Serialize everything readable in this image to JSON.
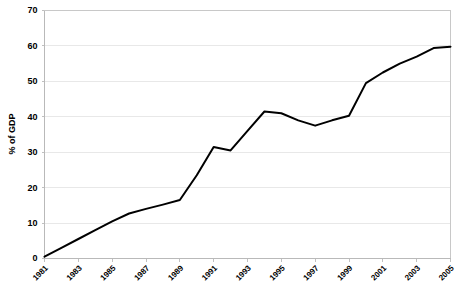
{
  "chart_data": {
    "type": "line",
    "title": "",
    "subtitle": "",
    "xlabel": "",
    "ylabel": "% of GDP",
    "ylim": [
      0,
      70
    ],
    "yticks": [
      0,
      10,
      20,
      30,
      40,
      50,
      60,
      70
    ],
    "ytick_labels": [
      "0",
      "10",
      "20",
      "30",
      "40",
      "50",
      "60",
      "70"
    ],
    "xlim": [
      1981,
      2005
    ],
    "xticks": [
      1981,
      1983,
      1985,
      1987,
      1989,
      1991,
      1993,
      1995,
      1997,
      1999,
      2001,
      2003,
      2005
    ],
    "xtick_labels": [
      "1981",
      "1983",
      "1985",
      "1987",
      "1989",
      "1991",
      "1993",
      "1995",
      "1997",
      "1999",
      "2001",
      "2003",
      "2005"
    ],
    "grid": true,
    "grid_axis": "y",
    "legend": false,
    "legend_position": "none",
    "line_color": "#000000",
    "grid_color": "#e8e8e8",
    "frame_color": "#c8c8c8",
    "background_color": "#ffffff",
    "x": [
      1981,
      1982,
      1983,
      1984,
      1985,
      1986,
      1987,
      1988,
      1989,
      1990,
      1991,
      1992,
      1993,
      1994,
      1995,
      1996,
      1997,
      1998,
      1999,
      2000,
      2001,
      2002,
      2003,
      2004,
      2005
    ],
    "series": [
      {
        "name": "% of GDP",
        "values": [
          0.5,
          3.0,
          5.5,
          8.0,
          10.5,
          12.7,
          14.0,
          15.2,
          16.5,
          23.5,
          31.5,
          30.5,
          36.0,
          41.5,
          41.0,
          39.0,
          37.5,
          39.0,
          40.3,
          49.5,
          52.5,
          55.0,
          57.0,
          59.4,
          59.8
        ]
      }
    ]
  },
  "axes": {
    "y_axis_title": "% of GDP"
  }
}
